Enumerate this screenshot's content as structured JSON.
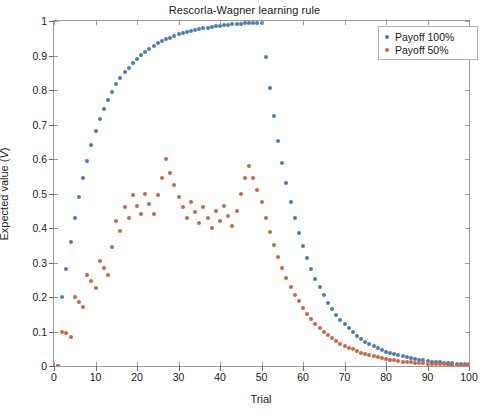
{
  "chart_data": {
    "type": "scatter",
    "title": "Rescorla-Wagner learning rule",
    "xlabel": "Trial",
    "ylabel": "Expected value (V)",
    "xlim": [
      0,
      100
    ],
    "ylim": [
      0,
      1
    ],
    "xticks": [
      0,
      10,
      20,
      30,
      40,
      50,
      60,
      70,
      80,
      90,
      100
    ],
    "yticks": [
      0,
      0.1,
      0.2,
      0.3,
      0.4,
      0.5,
      0.6,
      0.7,
      0.8,
      0.9,
      1
    ],
    "grid": false,
    "legend_position": "top-right",
    "marker": "filled-circle",
    "marker_size": 4,
    "colors": {
      "payoff_100": "#4a7ebb",
      "payoff_50": "#cc6644",
      "axis": "#9a9a9a",
      "text": "#1a1a1a",
      "background": "#ffffff"
    },
    "annotations": [
      "Acquisition phase trials 1-50, extinction phase trials 51-100"
    ],
    "series": [
      {
        "name": "Payoff 100%",
        "color": "#4a7ebb",
        "x": [
          1,
          2,
          3,
          4,
          5,
          6,
          7,
          8,
          9,
          10,
          11,
          12,
          13,
          14,
          15,
          16,
          17,
          18,
          19,
          20,
          21,
          22,
          23,
          24,
          25,
          26,
          27,
          28,
          29,
          30,
          31,
          32,
          33,
          34,
          35,
          36,
          37,
          38,
          39,
          40,
          41,
          42,
          43,
          44,
          45,
          46,
          47,
          48,
          49,
          50,
          51,
          52,
          53,
          54,
          55,
          56,
          57,
          58,
          59,
          60,
          61,
          62,
          63,
          64,
          65,
          66,
          67,
          68,
          69,
          70,
          71,
          72,
          73,
          74,
          75,
          76,
          77,
          78,
          79,
          80,
          81,
          82,
          83,
          84,
          85,
          86,
          87,
          88,
          89,
          90,
          91,
          92,
          93,
          94,
          95,
          96,
          97,
          98,
          99,
          100
        ],
        "y": [
          0,
          0.2,
          0.28,
          0.36,
          0.43,
          0.49,
          0.545,
          0.595,
          0.64,
          0.68,
          0.715,
          0.745,
          0.772,
          0.795,
          0.816,
          0.834,
          0.851,
          0.865,
          0.878,
          0.89,
          0.901,
          0.911,
          0.92,
          0.928,
          0.935,
          0.941,
          0.947,
          0.952,
          0.957,
          0.961,
          0.965,
          0.968,
          0.971,
          0.974,
          0.977,
          0.979,
          0.981,
          0.983,
          0.985,
          0.986,
          0.988,
          0.989,
          0.99,
          0.991,
          0.992,
          0.993,
          0.994,
          0.994,
          0.995,
          0.995,
          0.896,
          0.806,
          0.726,
          0.653,
          0.588,
          0.529,
          0.476,
          0.428,
          0.386,
          0.347,
          0.312,
          0.281,
          0.253,
          0.228,
          0.205,
          0.184,
          0.166,
          0.149,
          0.134,
          0.121,
          0.109,
          0.098,
          0.088,
          0.079,
          0.071,
          0.064,
          0.058,
          0.052,
          0.047,
          0.042,
          0.038,
          0.034,
          0.031,
          0.028,
          0.025,
          0.022,
          0.02,
          0.018,
          0.016,
          0.014,
          0.013,
          0.012,
          0.011,
          0.01,
          0.009,
          0.008,
          0.007,
          0.006,
          0.005,
          0.005
        ]
      },
      {
        "name": "Payoff 50%",
        "color": "#cc6644",
        "x": [
          1,
          2,
          3,
          4,
          5,
          6,
          7,
          8,
          9,
          10,
          11,
          12,
          13,
          14,
          15,
          16,
          17,
          18,
          19,
          20,
          21,
          22,
          23,
          24,
          25,
          26,
          27,
          28,
          29,
          30,
          31,
          32,
          33,
          34,
          35,
          36,
          37,
          38,
          39,
          40,
          41,
          42,
          43,
          44,
          45,
          46,
          47,
          48,
          49,
          50,
          51,
          52,
          53,
          54,
          55,
          56,
          57,
          58,
          59,
          60,
          61,
          62,
          63,
          64,
          65,
          66,
          67,
          68,
          69,
          70,
          71,
          72,
          73,
          74,
          75,
          76,
          77,
          78,
          79,
          80,
          81,
          82,
          83,
          84,
          85,
          86,
          87,
          88,
          89,
          90,
          91,
          92,
          93,
          94,
          95,
          96,
          97,
          98,
          99,
          100
        ],
        "y": [
          0,
          0.1,
          0.095,
          0.085,
          0.2,
          0.185,
          0.17,
          0.265,
          0.245,
          0.225,
          0.305,
          0.285,
          0.265,
          0.345,
          0.42,
          0.39,
          0.46,
          0.43,
          0.495,
          0.465,
          0.44,
          0.5,
          0.47,
          0.44,
          0.495,
          0.545,
          0.6,
          0.56,
          0.525,
          0.49,
          0.46,
          0.43,
          0.475,
          0.445,
          0.415,
          0.46,
          0.43,
          0.4,
          0.45,
          0.42,
          0.465,
          0.435,
          0.405,
          0.45,
          0.5,
          0.545,
          0.58,
          0.545,
          0.51,
          0.475,
          0.43,
          0.388,
          0.35,
          0.315,
          0.284,
          0.256,
          0.23,
          0.207,
          0.187,
          0.168,
          0.151,
          0.136,
          0.123,
          0.11,
          0.099,
          0.089,
          0.08,
          0.072,
          0.065,
          0.059,
          0.053,
          0.048,
          0.043,
          0.039,
          0.035,
          0.031,
          0.028,
          0.025,
          0.023,
          0.02,
          0.018,
          0.017,
          0.015,
          0.013,
          0.012,
          0.011,
          0.01,
          0.009,
          0.008,
          0.007,
          0.006,
          0.006,
          0.005,
          0.005,
          0.004,
          0.004,
          0.003,
          0.003,
          0.003,
          0.002
        ]
      }
    ]
  },
  "legend": {
    "items": [
      {
        "label": "Payoff 100%",
        "color": "#4a7ebb"
      },
      {
        "label": "Payoff 50%",
        "color": "#cc6644"
      }
    ]
  }
}
